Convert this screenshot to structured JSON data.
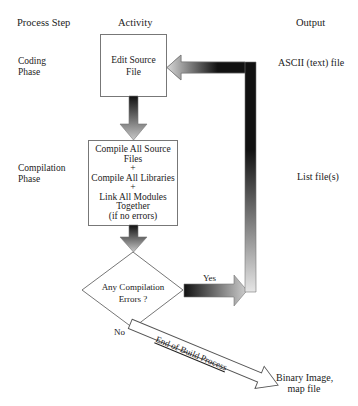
{
  "headers": {
    "process_step": "Process Step",
    "activity": "Activity",
    "output": "Output"
  },
  "phases": [
    {
      "line1": "Coding",
      "line2": "Phase"
    },
    {
      "line1": "Compilation",
      "line2": "Phase"
    }
  ],
  "activities": {
    "edit": {
      "line1": "Edit Source",
      "line2": "File"
    },
    "compile": {
      "lines": [
        "Compile All Source",
        "Files",
        "+",
        "Compile All Libraries",
        "+",
        "Link All Modules",
        "Together",
        "(if no errors)"
      ]
    },
    "decision": {
      "line1": "Any Compilation",
      "line2": "Errors ?"
    }
  },
  "branches": {
    "yes": "Yes",
    "no": "No",
    "end_arrow": "End of Build Process"
  },
  "outputs": {
    "ascii": "ASCII (text) file",
    "list": "List file(s)",
    "binary_line1": "Binary Image,",
    "binary_line2": "map file"
  }
}
